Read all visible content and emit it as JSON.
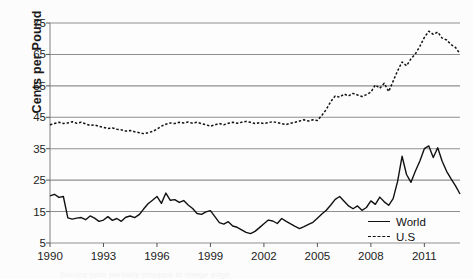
{
  "chart_data": {
    "type": "line",
    "title": "",
    "xlabel": "",
    "ylabel": "Cents per Pound",
    "xlim": [
      1990,
      2013
    ],
    "ylim": [
      5,
      75
    ],
    "ytick_labels": [
      "75",
      "65",
      "55",
      "45",
      "35",
      "25",
      "15",
      "5"
    ],
    "ytick_values": [
      75,
      65,
      55,
      45,
      35,
      25,
      15,
      5
    ],
    "xtick_labels": [
      "1990",
      "1993",
      "1996",
      "1999",
      "2002",
      "2005",
      "2008",
      "2011"
    ],
    "xtick_values": [
      1990,
      1993,
      1996,
      1999,
      2002,
      2005,
      2008,
      2011
    ],
    "grid": true,
    "legend_position": "bottom-right",
    "series": [
      {
        "name": "World",
        "style": "solid",
        "color": "#111111",
        "x": [
          1990.0,
          1990.25,
          1990.5,
          1990.75,
          1991.0,
          1991.25,
          1991.5,
          1991.75,
          1992.0,
          1992.25,
          1992.5,
          1992.75,
          1993.0,
          1993.25,
          1993.5,
          1993.75,
          1994.0,
          1994.25,
          1994.5,
          1994.75,
          1995.0,
          1995.25,
          1995.5,
          1995.75,
          1996.0,
          1996.25,
          1996.5,
          1996.75,
          1997.0,
          1997.25,
          1997.5,
          1997.75,
          1998.0,
          1998.25,
          1998.5,
          1998.75,
          1999.0,
          1999.25,
          1999.5,
          1999.75,
          2000.0,
          2000.25,
          2000.5,
          2000.75,
          2001.0,
          2001.25,
          2001.5,
          2001.75,
          2002.0,
          2002.25,
          2002.5,
          2002.75,
          2003.0,
          2003.25,
          2003.5,
          2003.75,
          2004.0,
          2004.25,
          2004.5,
          2004.75,
          2005.0,
          2005.25,
          2005.5,
          2005.75,
          2006.0,
          2006.25,
          2006.5,
          2006.75,
          2007.0,
          2007.25,
          2007.5,
          2007.75,
          2008.0,
          2008.25,
          2008.5,
          2008.75,
          2009.0,
          2009.25,
          2009.5,
          2009.75,
          2010.0,
          2010.25,
          2010.5,
          2010.75,
          2011.0,
          2011.25,
          2011.5,
          2011.75,
          2012.0,
          2012.25,
          2012.5,
          2012.75,
          2013.0
        ],
        "values": [
          20.0,
          20.5,
          19.5,
          19.8,
          13.0,
          12.6,
          12.9,
          13.1,
          12.4,
          13.6,
          12.9,
          11.9,
          12.3,
          13.4,
          12.2,
          12.8,
          11.9,
          13.2,
          13.6,
          13.1,
          14.0,
          15.8,
          17.5,
          18.6,
          19.8,
          17.6,
          20.9,
          18.6,
          18.8,
          17.9,
          18.5,
          17.1,
          16.0,
          14.4,
          14.1,
          14.9,
          15.3,
          13.4,
          11.5,
          11.0,
          11.8,
          10.4,
          10.0,
          9.2,
          8.4,
          8.0,
          8.7,
          9.9,
          11.1,
          12.3,
          12.0,
          11.2,
          12.8,
          11.9,
          11.1,
          10.3,
          9.6,
          10.2,
          10.9,
          11.6,
          12.9,
          14.2,
          15.4,
          17.1,
          18.9,
          19.8,
          18.3,
          16.8,
          15.9,
          16.8,
          15.4,
          16.3,
          18.4,
          17.3,
          19.6,
          18.1,
          17.0,
          19.1,
          24.6,
          32.6,
          26.8,
          24.3,
          27.9,
          31.1,
          35.0,
          35.9,
          32.2,
          35.3,
          31.0,
          27.8,
          25.4,
          23.2,
          20.6
        ]
      },
      {
        "name": "U.S",
        "style": "dashed",
        "color": "#111111",
        "x": [
          1990.0,
          1990.25,
          1990.5,
          1990.75,
          1991.0,
          1991.25,
          1991.5,
          1991.75,
          1992.0,
          1992.25,
          1992.5,
          1992.75,
          1993.0,
          1993.25,
          1993.5,
          1993.75,
          1994.0,
          1994.25,
          1994.5,
          1994.75,
          1995.0,
          1995.25,
          1995.5,
          1995.75,
          1996.0,
          1996.25,
          1996.5,
          1996.75,
          1997.0,
          1997.25,
          1997.5,
          1997.75,
          1998.0,
          1998.25,
          1998.5,
          1998.75,
          1999.0,
          1999.25,
          1999.5,
          1999.75,
          2000.0,
          2000.25,
          2000.5,
          2000.75,
          2001.0,
          2001.25,
          2001.5,
          2001.75,
          2002.0,
          2002.25,
          2002.5,
          2002.75,
          2003.0,
          2003.25,
          2003.5,
          2003.75,
          2004.0,
          2004.25,
          2004.5,
          2004.75,
          2005.0,
          2005.25,
          2005.5,
          2005.75,
          2006.0,
          2006.25,
          2006.5,
          2006.75,
          2007.0,
          2007.25,
          2007.5,
          2007.75,
          2008.0,
          2008.25,
          2008.5,
          2008.75,
          2009.0,
          2009.25,
          2009.5,
          2009.75,
          2010.0,
          2010.25,
          2010.5,
          2010.75,
          2011.0,
          2011.25,
          2011.5,
          2011.75,
          2012.0,
          2012.25,
          2012.5,
          2012.75,
          2013.0
        ],
        "values": [
          42.6,
          43.0,
          43.4,
          43.0,
          43.2,
          43.6,
          43.1,
          43.4,
          42.9,
          42.4,
          42.6,
          42.1,
          41.8,
          41.4,
          41.6,
          41.2,
          41.0,
          40.6,
          40.8,
          40.4,
          40.1,
          39.8,
          40.1,
          40.5,
          41.2,
          42.2,
          42.8,
          43.2,
          43.0,
          43.4,
          43.2,
          43.5,
          43.1,
          43.4,
          43.0,
          42.6,
          42.2,
          42.6,
          43.0,
          42.6,
          43.1,
          43.4,
          43.1,
          43.4,
          43.7,
          43.4,
          43.0,
          43.3,
          43.0,
          43.3,
          43.6,
          43.3,
          43.0,
          42.7,
          43.1,
          43.4,
          43.8,
          44.2,
          43.8,
          44.2,
          44.0,
          45.6,
          47.5,
          50.0,
          51.8,
          51.4,
          52.4,
          51.8,
          52.6,
          52.1,
          51.6,
          52.2,
          53.0,
          55.3,
          54.2,
          55.8,
          53.2,
          56.5,
          59.8,
          62.6,
          61.4,
          63.6,
          65.2,
          67.6,
          70.4,
          72.4,
          71.4,
          72.1,
          70.2,
          69.6,
          68.1,
          67.2,
          65.2
        ]
      }
    ]
  },
  "legend": {
    "items": [
      {
        "label": "World",
        "style": "solid"
      },
      {
        "label": "U.S",
        "style": "dashed"
      }
    ]
  },
  "footer": {
    "caption_fragment": "Source note partially cropped at image edge"
  }
}
